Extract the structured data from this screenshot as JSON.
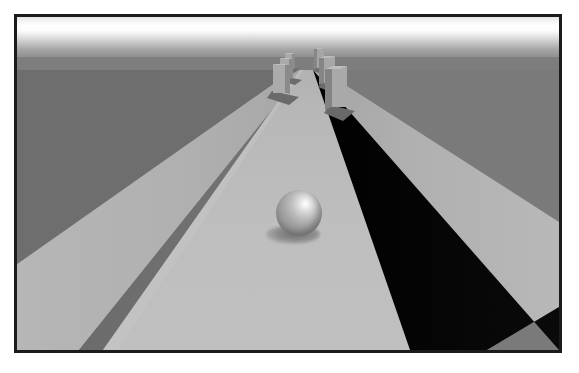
{
  "scene": {
    "title": "3D Perspective Corridor Render",
    "description": "Grayscale ray-traced perspective view down a raised walkway with rectangular block obstacles and a reflective sphere resting on the path.",
    "renderer_style": "raytraced-grayscale",
    "frame": {
      "border_color": "#1b1b1b",
      "border_width_px": 3,
      "outer_margin_px": 14,
      "canvas_width_px": 548,
      "canvas_height_px": 339
    },
    "camera": {
      "vanishing_point_x_px": 290,
      "horizon_y_px": 53
    },
    "palette": {
      "sky_top": "#e4e4e4",
      "sky_bright_band": "#ffffff",
      "sky_horizon": "#909090",
      "ground_far": "#7d7d7d",
      "path_top": "#b9b9b9",
      "path_top_bright": "#c4c4c4",
      "wall_left_shadow_side": "#6f6f6f",
      "wall_right_deep_shadow": "#050505",
      "wall_cap_light": "#b4b4b4",
      "block_face_light": "#b0b0b0",
      "block_face_mid": "#9a9a9a",
      "block_face_dark": "#7a7a7a",
      "block_shadow": "#6d6d6d",
      "sphere_highlight": "#ffffff",
      "sphere_body": "#a6a6a6",
      "sphere_terminator": "#7e7e7e",
      "sphere_contact_shadow": "#4b4b4b"
    },
    "elements": {
      "sky_label": "Gradient sky band",
      "ground_label": "Flat ground plane",
      "left_wall_label": "Left wall, shaded side face",
      "left_wall_cap_label": "Left wall top cap, lit",
      "right_wall_label": "Right wall, deep cast shadow",
      "right_wall_cap_label": "Right wall top cap, lit",
      "path_label": "Central walkway surface",
      "sphere_label": "Specular sphere on walkway",
      "sphere_shadow_label": "Sphere contact shadow",
      "blocks_label": "Rectangular block obstacles"
    },
    "blocks": [
      {
        "id": "block-l1",
        "side": "left",
        "x": 268,
        "y": 34,
        "w": 7,
        "h": 16,
        "depth": 3
      },
      {
        "id": "block-l2",
        "side": "left",
        "x": 263,
        "y": 40,
        "w": 9,
        "h": 21,
        "depth": 4
      },
      {
        "id": "block-l3",
        "side": "left",
        "x": 256,
        "y": 46,
        "w": 12,
        "h": 28,
        "depth": 5
      },
      {
        "id": "block-r1",
        "side": "right",
        "x": 300,
        "y": 30,
        "w": 8,
        "h": 19,
        "depth": 3
      },
      {
        "id": "block-r2",
        "side": "right",
        "x": 307,
        "y": 38,
        "w": 11,
        "h": 26,
        "depth": 4
      },
      {
        "id": "block-r3",
        "side": "right",
        "x": 315,
        "y": 48,
        "w": 15,
        "h": 38,
        "depth": 6
      }
    ],
    "sphere": {
      "center_x_px": 285,
      "center_y_px": 199,
      "radius_px": 23,
      "highlight_x_pct": 64,
      "highlight_y_pct": 30
    }
  }
}
